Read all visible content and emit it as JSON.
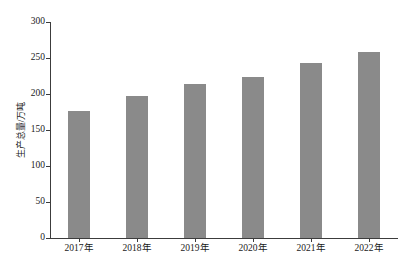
{
  "chart_data": {
    "type": "bar",
    "title": "",
    "subtitle": "",
    "xlabel": "",
    "ylabel": "生产总量/万吨",
    "categories": [
      "2017年",
      "2018年",
      "2019年",
      "2020年",
      "2021年",
      "2022年"
    ],
    "values": [
      176,
      197,
      214,
      224,
      243,
      258
    ],
    "series": [
      {
        "name": "生产总量",
        "values": [
          176,
          197,
          214,
          224,
          243,
          258
        ]
      }
    ],
    "ylim": [
      0,
      300
    ],
    "yticks": [
      0,
      50,
      100,
      150,
      200,
      250,
      300
    ],
    "ytick_labels": [
      "0",
      "50",
      "100",
      "150",
      "200",
      "250",
      "300"
    ],
    "grid": false,
    "legend": false,
    "legend_position": "none",
    "bar_color": "#8a8a8a",
    "axis_color": "#3c3c3c",
    "background_color": "#ffffff"
  }
}
